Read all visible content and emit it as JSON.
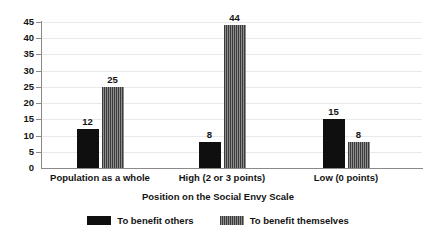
{
  "chart_data": {
    "type": "bar",
    "title": "",
    "xlabel": "Position on the Social Envy Scale",
    "ylabel": "",
    "categories": [
      "Population as a whole",
      "High (2 or 3 points)",
      "Low (0 points)"
    ],
    "series": [
      {
        "name": "To benefit others",
        "pattern": "solid",
        "color": "#0f0f0f",
        "values": [
          12,
          8,
          15
        ]
      },
      {
        "name": "To benefit themselves",
        "pattern": "vertical-stripes",
        "color": "#4a4a4a",
        "values": [
          25,
          44,
          8
        ]
      }
    ],
    "ylim": [
      0,
      45
    ],
    "ytick_labels": [
      "0",
      "5",
      "10",
      "15",
      "20",
      "25",
      "30",
      "35",
      "40",
      "45"
    ],
    "yticks": [
      0,
      5,
      10,
      15,
      20,
      25,
      30,
      35,
      40,
      45
    ],
    "grid": true,
    "grid_axis": "y",
    "legend_position": "bottom",
    "data_labels": true,
    "background_color": "#ffffff",
    "axis_color": "#8a8a8a",
    "gridline_color": "#e9e9e9",
    "text_color": "#141414"
  }
}
